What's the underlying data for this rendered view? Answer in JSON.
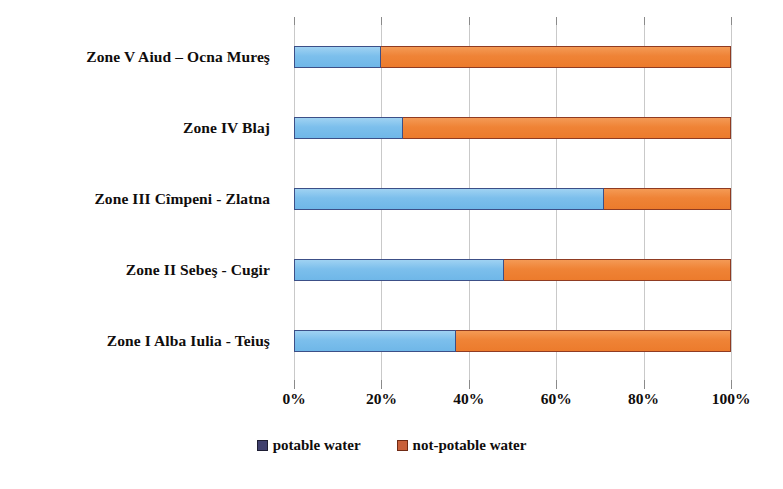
{
  "chart_data": {
    "type": "bar",
    "subtype": "horizontal-100-percent-stacked",
    "title": "",
    "xlabel": "",
    "ylabel": "",
    "xlim": [
      0,
      100
    ],
    "grid": true,
    "grid_axis": "x",
    "legend_position": "bottom-center",
    "categories": [
      "Zone I Alba Iulia  - Teiuş",
      "Zone II Sebeş - Cugir",
      "Zone III Cîmpeni - Zlatna",
      "Zone IV Blaj",
      "Zone V Aiud – Ocna Mureş"
    ],
    "category_order_top_to_bottom": [
      "Zone V Aiud – Ocna Mureş",
      "Zone IV Blaj",
      "Zone III Cîmpeni - Zlatna",
      "Zone II Sebeş - Cugir",
      "Zone I Alba Iulia  - Teiuş"
    ],
    "series": [
      {
        "name": "potable water",
        "color": "#7cbfec",
        "border_color": "#3c4f87",
        "legend_color": "#3f3f6e",
        "values": [
          37,
          48,
          71,
          25,
          20
        ]
      },
      {
        "name": "not-potable water",
        "color": "#ef8336",
        "border_color": "#8f3b22",
        "legend_color": "#c8603a",
        "values": [
          63,
          52,
          29,
          75,
          80
        ]
      }
    ],
    "xticks": [
      0,
      20,
      40,
      60,
      80,
      100
    ],
    "xtick_labels": [
      "0%",
      "20%",
      "40%",
      "60%",
      "80%",
      "100%"
    ]
  },
  "bars": [
    {
      "label": "Zone V Aiud – Ocna Mureş",
      "potable": 20,
      "not_potable": 80
    },
    {
      "label": "Zone IV Blaj",
      "potable": 25,
      "not_potable": 75
    },
    {
      "label": "Zone III Cîmpeni - Zlatna",
      "potable": 71,
      "not_potable": 29
    },
    {
      "label": "Zone II Sebeş - Cugir",
      "potable": 48,
      "not_potable": 52
    },
    {
      "label": "Zone I Alba Iulia  - Teiuş",
      "potable": 37,
      "not_potable": 63
    }
  ],
  "legend": {
    "items": [
      {
        "label": "potable water"
      },
      {
        "label": "not-potable water"
      }
    ]
  },
  "axis": {
    "xtick_labels": [
      "0%",
      "20%",
      "40%",
      "60%",
      "80%",
      "100%"
    ]
  }
}
